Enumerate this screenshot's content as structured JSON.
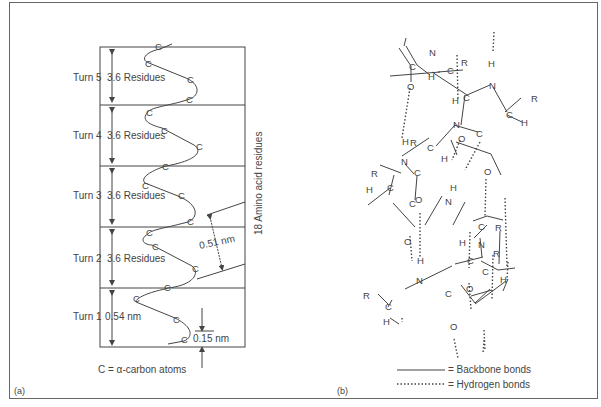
{
  "panel_a": {
    "label": "(a)",
    "turns": [
      {
        "name": "Turn 5",
        "residues": "3.6 Residues"
      },
      {
        "name": "Turn 4",
        "residues": "3.6 Residues"
      },
      {
        "name": "Turn 3",
        "residues": "3.6 Residues"
      },
      {
        "name": "Turn 2",
        "residues": "3.6 Residues"
      },
      {
        "name": "Turn 1",
        "residues": "0.54 nm"
      }
    ],
    "side_label": "18 Amino acid residues",
    "pitch_label": "0.51 nm",
    "rise_label": "0.15 nm",
    "atom_symbol": "C",
    "key": "C = α-carbon atoms"
  },
  "panel_b": {
    "label": "(b)",
    "atoms": {
      "C": "C",
      "N": "N",
      "O": "O",
      "H": "H",
      "R": "R"
    },
    "legend": [
      {
        "style": "solid",
        "text": "= Backbone bonds"
      },
      {
        "style": "dotted",
        "text": "= Hydrogen bonds"
      }
    ]
  },
  "colors": {
    "ink": "#444444",
    "frame": "#666666",
    "background": "#ffffff"
  }
}
